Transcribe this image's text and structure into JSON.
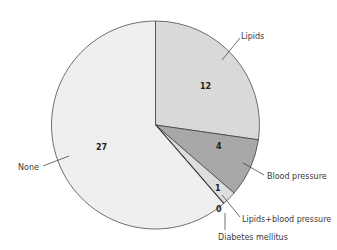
{
  "chart_data": {
    "type": "pie",
    "title": "",
    "start_angle_deg": 0,
    "direction": "clockwise",
    "total": 44,
    "slices": [
      {
        "label": "Lipids",
        "value": 12,
        "value_label": "12",
        "color": "#d9d9d9"
      },
      {
        "label": "Blood pressure",
        "value": 4,
        "value_label": "4",
        "color": "#a8a8a8"
      },
      {
        "label": "Lipids+blood pressure",
        "value": 1,
        "value_label": "1",
        "color": "#dedede"
      },
      {
        "label": "Diabetes mellitus",
        "value": 0,
        "value_label": "0",
        "color": "#c0c0c0"
      },
      {
        "label": "None",
        "value": 27,
        "value_label": "27",
        "color": "#efefef"
      }
    ],
    "legend": "none (callout labels with leader lines)"
  },
  "labels": {
    "lipids": "Lipids",
    "blood_pressure": "Blood pressure",
    "lipids_bp": "Lipids+blood pressure",
    "diabetes": "Diabetes mellitus",
    "none": "None"
  },
  "values": {
    "lipids": "12",
    "blood_pressure": "4",
    "lipids_bp": "1",
    "diabetes": "0",
    "none": "27"
  }
}
